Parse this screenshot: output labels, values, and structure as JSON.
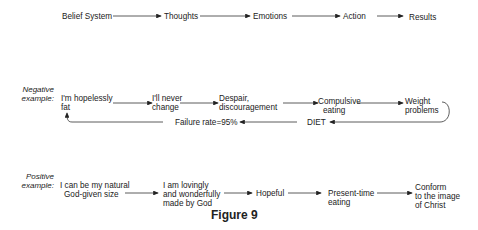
{
  "top_row": {
    "nodes": [
      "Belief System",
      "Thoughts",
      "Emotions",
      "Action",
      "Results"
    ]
  },
  "negative": {
    "label_1": "Negative",
    "label_2": "example:",
    "nodes": [
      {
        "l1": "I'm hopelessly",
        "l2": "fat"
      },
      {
        "l1": "I'll never",
        "l2": "change"
      },
      {
        "l1": "Despair,",
        "l2": "discouragement"
      },
      {
        "l1": "Compulsive",
        "l2": "eating"
      },
      {
        "l1": "Weight",
        "l2": "problems"
      }
    ],
    "return_nodes": [
      "DIET",
      "Failure rate=95%"
    ]
  },
  "positive": {
    "label_1": "Positive",
    "label_2": "example:",
    "nodes": [
      {
        "l1": "I can be my natural",
        "l2": "God-given size",
        "l3": ""
      },
      {
        "l1": "I am lovingly",
        "l2": "and wonderfully",
        "l3": "made by God"
      },
      {
        "l1": "Hopeful",
        "l2": "",
        "l3": ""
      },
      {
        "l1": "Present-time",
        "l2": "eating",
        "l3": ""
      },
      {
        "l1": "Conform",
        "l2": "to the image",
        "l3": "of Christ"
      }
    ]
  },
  "caption": "Figure 9"
}
